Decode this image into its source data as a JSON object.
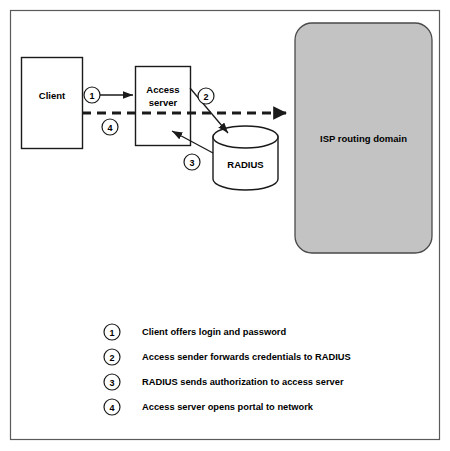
{
  "figure": {
    "background_color": "#ffffff",
    "frame": {
      "stroke_color": "#5a5a5a"
    }
  },
  "nodes": {
    "client": {
      "label": "Client",
      "shape": "rectangle",
      "fill_color": "#ffffff",
      "stroke_color": "#1a1a1a"
    },
    "access_server": {
      "label_line1": "Access",
      "label_line2": "server",
      "shape": "rectangle",
      "fill_color": "#ffffff",
      "stroke_color": "#1a1a1a"
    },
    "radius": {
      "label": "RADIUS",
      "shape": "cylinder",
      "fill_color": "#ffffff",
      "stroke_color": "#1a1a1a"
    },
    "isp_domain": {
      "label": "ISP routing  domain",
      "shape": "rounded-rectangle",
      "fill_color": "#c3c3c3",
      "stroke_color": "#4a4a4a"
    }
  },
  "flow_markers": {
    "one": "1",
    "two": "2",
    "three": "3",
    "four": "4"
  },
  "legend": {
    "items": [
      {
        "number": "1",
        "text": "Client offers login and password"
      },
      {
        "number": "2",
        "text": "Access sender forwards credentials to RADIUS"
      },
      {
        "number": "3",
        "text": "RADIUS sends authorization to access server"
      },
      {
        "number": "4",
        "text": "Access server opens portal to network"
      }
    ]
  }
}
